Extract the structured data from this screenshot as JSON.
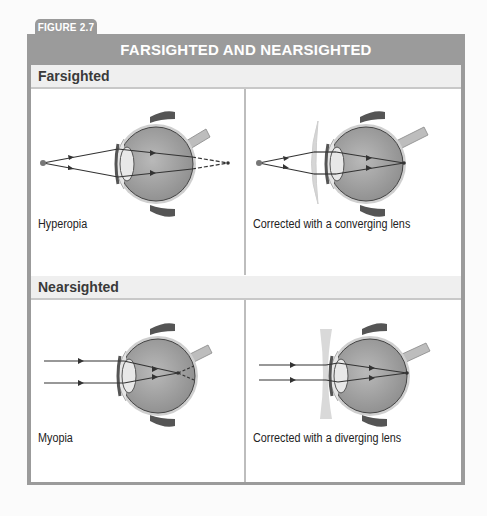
{
  "figure": {
    "tab_label": "FIGURE 2.7",
    "title": "FARSIGHTED AND NEARSIGHTED",
    "colors": {
      "frame": "#9b9b9b",
      "subheader_bg": "#efefef",
      "ray": "#333333",
      "lens": "#d8d8d8"
    }
  },
  "sections": [
    {
      "heading": "Farsighted",
      "panels": [
        {
          "caption": "Hyperopia",
          "light_source": "point",
          "lens": "none",
          "focus": "behind retina"
        },
        {
          "caption": "Corrected with a converging lens",
          "light_source": "point",
          "lens": "converging",
          "focus": "on retina"
        }
      ]
    },
    {
      "heading": "Nearsighted",
      "panels": [
        {
          "caption": "Myopia",
          "light_source": "parallel rays",
          "lens": "none",
          "focus": "in front of retina"
        },
        {
          "caption": "Corrected with a diverging lens",
          "light_source": "parallel rays",
          "lens": "diverging",
          "focus": "on retina"
        }
      ]
    }
  ]
}
